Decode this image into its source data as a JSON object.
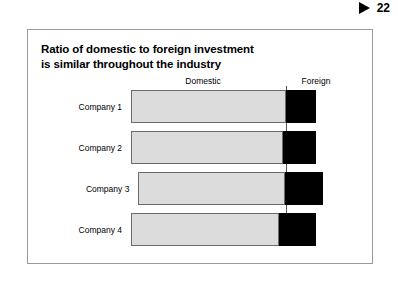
{
  "page_marker": {
    "triangle_icon": "play-triangle-icon",
    "number": "22"
  },
  "slide": {
    "title_line1": "Ratio of domestic to foreign investment",
    "title_line2": "is similar throughout the industry"
  },
  "chart_data": {
    "type": "bar",
    "orientation": "horizontal",
    "stacked": true,
    "title": "Ratio of domestic to foreign investment is similar throughout the industry",
    "xlabel": "",
    "ylabel": "",
    "grid": false,
    "legend_position": "top",
    "column_headers": [
      "Domestic",
      "Foreign"
    ],
    "categories": [
      "Company 1",
      "Company 2",
      "Company 3",
      "Company 4"
    ],
    "series": [
      {
        "name": "Domestic",
        "color": "#dcdcdc",
        "values": [
          84,
          82,
          79,
          80
        ]
      },
      {
        "name": "Foreign",
        "color": "#000000",
        "values": [
          16,
          18,
          21,
          20
        ]
      }
    ],
    "rows": [
      {
        "label": "Company 1",
        "start": 0,
        "domestic": 84,
        "foreign": 16
      },
      {
        "label": "Company 2",
        "start": 0,
        "domestic": 82,
        "foreign": 18
      },
      {
        "label": "Company 3",
        "start": 4,
        "domestic": 79,
        "foreign": 21
      },
      {
        "label": "Company 4",
        "start": 0,
        "domestic": 80,
        "foreign": 20
      }
    ],
    "annotations": [
      "vertical divider separating domestic and foreign segments"
    ]
  },
  "colors": {
    "domestic_fill": "#dcdcdc",
    "domestic_border": "#6b6b6b",
    "foreign_fill": "#000000",
    "frame_border": "#9a9a9a",
    "divider": "#555555"
  }
}
